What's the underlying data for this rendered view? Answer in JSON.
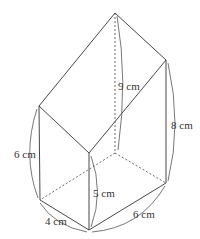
{
  "figure": {
    "type": "solid-diagram",
    "labels": {
      "apex_height": "9 cm",
      "right_height": "8 cm",
      "left_height": "6 cm",
      "front_height": "5 cm",
      "front_left_base": "4 cm",
      "front_right_base": "6 cm"
    },
    "colors": {
      "line": "#333333",
      "background": "#ffffff"
    }
  }
}
